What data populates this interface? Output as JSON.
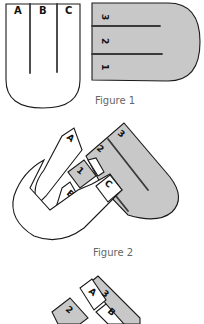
{
  "figures": [
    {
      "caption": "Figure 1",
      "white_piece": {
        "strip_labels": [
          "A",
          "B",
          "C"
        ]
      },
      "gray_piece": {
        "strip_labels": [
          "3",
          "2",
          "1"
        ]
      }
    },
    {
      "caption": "Figure 2",
      "white_piece": {
        "strip_labels": [
          "A",
          "B",
          "C"
        ]
      },
      "gray_piece": {
        "strip_labels": [
          "1",
          "2",
          "3"
        ]
      }
    },
    {
      "caption": "",
      "labels": [
        "A",
        "3",
        "2",
        "B"
      ]
    }
  ],
  "colors": {
    "gray_piece": "#c8c8c8",
    "white_piece": "#ffffff",
    "outline": "#1a1a1a",
    "caption": "#666666"
  }
}
